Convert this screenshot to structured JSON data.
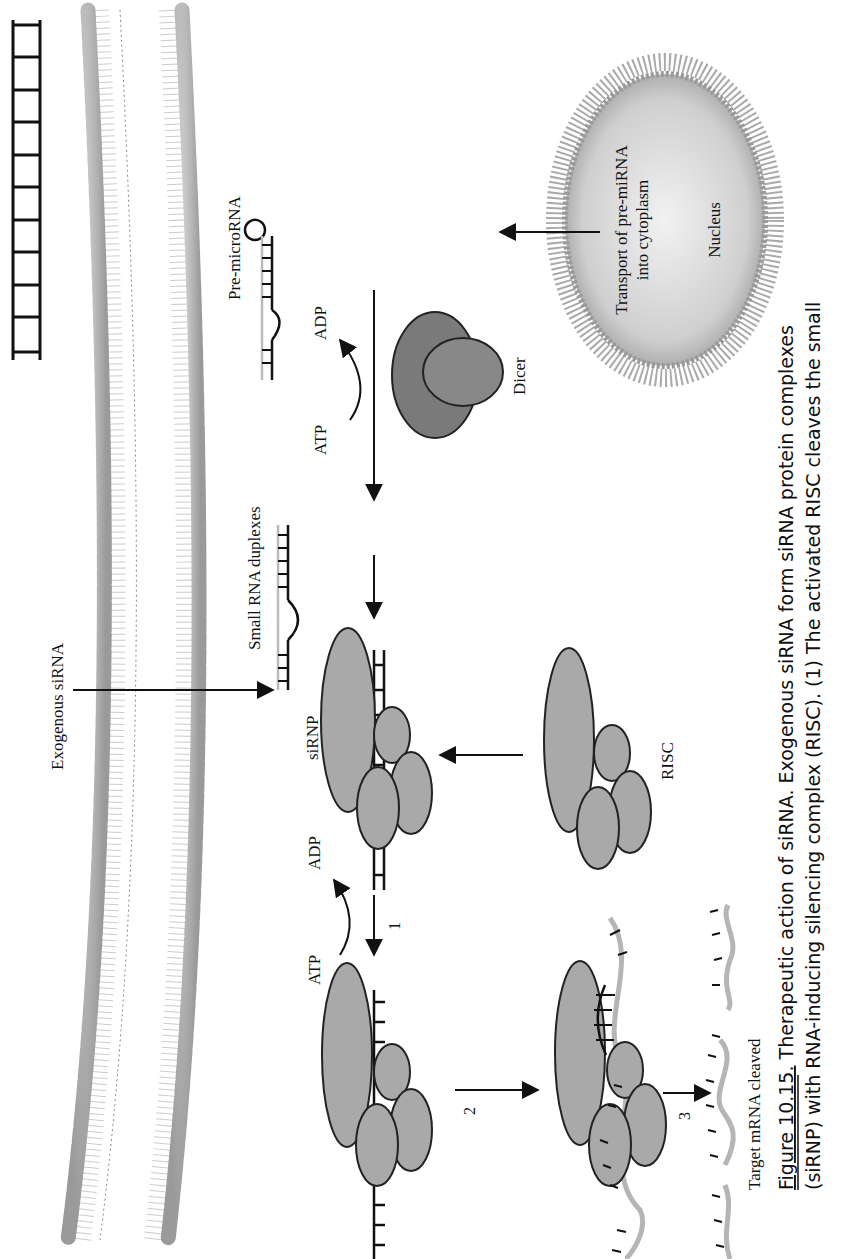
{
  "figure": {
    "orientation": "rotated 90deg counter-clockwise",
    "labels": {
      "exogenous_sirna": "Exogenous siRNA",
      "pre_microrna": "Pre-microRNA",
      "transport_line1": "Transport of pre-miRNA",
      "transport_line2": "into cytoplasm",
      "nucleus": "Nucleus",
      "dicer": "Dicer",
      "atp_top": "ATP",
      "adp_top": "ADP",
      "small_rna_duplexes": "Small RNA duplexes",
      "sirnp": "siRNP",
      "risc": "RISC",
      "atp_bottom": "ATP",
      "adp_bottom": "ADP",
      "step1": "1",
      "step2": "2",
      "step3": "3",
      "target_mrna_cleaved": "Target mRNA cleaved"
    },
    "colors": {
      "protein_fill": "#a9a9a9",
      "dicer_fill": "#7a7a7a",
      "membrane_head": "#b8b8b8",
      "mrna_strand": "#b5b5b5",
      "nucleus_fill": "#c8c8c8"
    }
  },
  "caption": {
    "figure_number": "Figure 10.15.",
    "line1_rest": " Therapeutic action of siRNA. Exogenous siRNA form siRNA protein complexes",
    "line2": "(siRNP) with RNA-inducing silencing complex (RISC). (1) The activated RISC cleaves the small"
  }
}
